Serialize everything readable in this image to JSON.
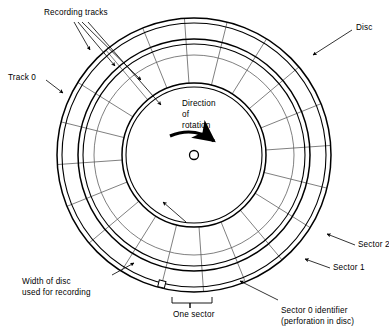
{
  "figure": {
    "background_color": "#ffffff",
    "line_color": "#000000",
    "thin_line_color": "#555555"
  },
  "geometry": {
    "center_x": 194,
    "center_y": 155,
    "disc_outer_radius": 137,
    "disc_outer_inner_radius": 132,
    "ring2_outer_radius": 116,
    "ring2_inner_radius": 111,
    "track_mid_radius": 100,
    "hub_outer_radius": 72,
    "hub_inner_radius": 68,
    "spindle_hole_radius": 4.5,
    "sector_count": 20,
    "sector_zero_angle_deg": 104
  },
  "labels": {
    "recording_tracks": "Recording tracks",
    "track_zero": "Track 0",
    "disc": "Disc",
    "direction_line1": "Direction",
    "direction_line2": "of",
    "direction_line3": "rotation",
    "sector_two": "Sector 2",
    "sector_one": "Sector 1",
    "sector_zero_line1": "Sector 0 identifier",
    "sector_zero_line2": "(perforation in disc)",
    "one_sector": "One sector",
    "width_line1": "Width of disc",
    "width_line2": "used for recording"
  },
  "icons": {
    "rotation_arrow": "curved-clockwise-arrow",
    "spindle_hole": "circle-outline",
    "leader_arrow": "arrowhead",
    "sector_bracket": "bracket"
  }
}
